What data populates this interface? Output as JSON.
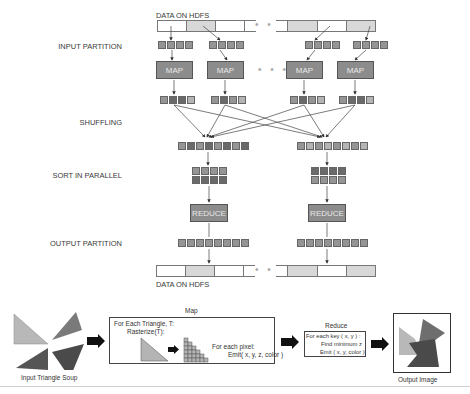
{
  "diagram": {
    "top_hdfs_label": "DATA ON HDFS",
    "bottom_hdfs_label": "DATA ON HDFS",
    "stages": {
      "input_partition": "INPUT PARTITION",
      "shuffling": "SHUFFLING",
      "sort_in_parallel": "SORT IN PARALLEL",
      "output_partition": "OUTPUT PARTITION"
    },
    "map_boxes": [
      "MAP",
      "MAP",
      "MAP",
      "MAP"
    ],
    "reduce_boxes": [
      "REDUCE",
      "REDUCE"
    ],
    "ellipsis": "• • •",
    "colors": {
      "box_fill": "#8c8c8c",
      "shaded_cell": "#d8d8d8",
      "dark_square": "#6a6a6a",
      "light_square": "#b4b4b4"
    }
  },
  "pipeline": {
    "input_label": "Input Triangle Soup",
    "map_title": "Map",
    "map_line1": "For Each Triangle, T:",
    "map_line2": "Rasterize(T):",
    "map_pixel_line1": "For each pixel:",
    "map_pixel_line2": "Emit( x, y, z, color )",
    "reduce_title": "Reduce",
    "reduce_line1": "For each key ( x, y ) :",
    "reduce_line2": "Find minimum z",
    "reduce_line3": "Emit ( x, y, color )",
    "output_label": "Output Image"
  }
}
